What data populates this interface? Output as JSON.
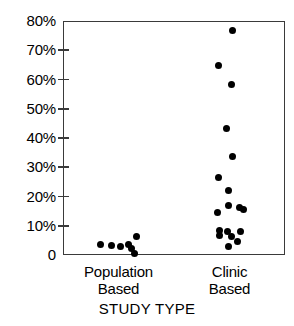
{
  "chart_data": {
    "type": "scatter",
    "title": "",
    "xlabel": "STUDY TYPE",
    "ylabel": "",
    "categories": [
      "Population Based",
      "Clinic Based"
    ],
    "category_labels": [
      {
        "line1": "Population",
        "line2": "Based"
      },
      {
        "line1": "Clinic",
        "line2": "Based"
      }
    ],
    "ylim": [
      0,
      80
    ],
    "ytick_values": [
      0,
      10,
      20,
      30,
      40,
      50,
      60,
      70,
      80
    ],
    "ytick_labels": [
      "0",
      "10%",
      "20%",
      "30%",
      "40%",
      "50%",
      "60%",
      "70%",
      "80%"
    ],
    "grid": false,
    "legend": null,
    "axis_color": "#3a3a3a",
    "point_color": "#000000",
    "series": [
      {
        "name": "Population Based",
        "category_index": 0,
        "points": [
          {
            "x_offset": -0.085,
            "value": 4.0
          },
          {
            "x_offset": -0.035,
            "value": 3.6
          },
          {
            "x_offset": 0.005,
            "value": 3.4
          },
          {
            "x_offset": 0.04,
            "value": 3.9
          },
          {
            "x_offset": 0.055,
            "value": 2.6
          },
          {
            "x_offset": 0.075,
            "value": 6.6
          },
          {
            "x_offset": 0.068,
            "value": 1.0
          }
        ]
      },
      {
        "name": "Clinic Based",
        "category_index": 1,
        "points": [
          {
            "x_offset": 0.01,
            "value": 77.0
          },
          {
            "x_offset": -0.055,
            "value": 65.0
          },
          {
            "x_offset": 0.005,
            "value": 58.5
          },
          {
            "x_offset": -0.02,
            "value": 43.5
          },
          {
            "x_offset": 0.01,
            "value": 34.0
          },
          {
            "x_offset": -0.055,
            "value": 26.8
          },
          {
            "x_offset": -0.01,
            "value": 22.5
          },
          {
            "x_offset": -0.01,
            "value": 17.2
          },
          {
            "x_offset": -0.06,
            "value": 15.0
          },
          {
            "x_offset": 0.042,
            "value": 16.6
          },
          {
            "x_offset": 0.058,
            "value": 16.0
          },
          {
            "x_offset": -0.048,
            "value": 8.6
          },
          {
            "x_offset": -0.048,
            "value": 7.0
          },
          {
            "x_offset": -0.015,
            "value": 8.4
          },
          {
            "x_offset": 0.005,
            "value": 6.6
          },
          {
            "x_offset": 0.045,
            "value": 8.4
          },
          {
            "x_offset": 0.032,
            "value": 5.0
          },
          {
            "x_offset": -0.01,
            "value": 3.4
          }
        ]
      }
    ]
  }
}
